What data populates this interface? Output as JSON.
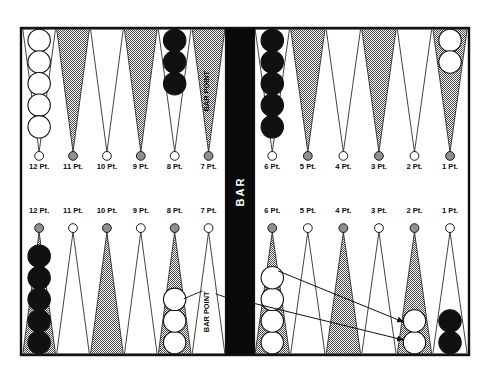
{
  "headers": {
    "top_left": "BLACK'S OUTER BOARD",
    "top_right": "BLACK'S HOME BOARD",
    "bottom_left": "WHITE'S OUTER BOARD",
    "bottom_right": "WHITE'S HOME BOARD"
  },
  "bar": {
    "label": "BAR",
    "color": "#0a0a0a",
    "text_color": "#ffffff"
  },
  "annotations": {
    "bar_point_top": "BAR POINT",
    "bar_point_bottom": "BAR POINT"
  },
  "colors": {
    "point_light": "#ffffff",
    "point_dark": "#a8a8a8",
    "checker_black": "#111111",
    "checker_white": "#ffffff",
    "border": "#111111",
    "text": "#0c0c0c"
  },
  "points": {
    "top": [
      {
        "label": "12 Pt.",
        "triangle": "light",
        "nub": "white",
        "checkers": 5,
        "checker_color": "white"
      },
      {
        "label": "11 Pt.",
        "triangle": "dark",
        "nub": "gray",
        "checkers": 0,
        "checker_color": "none"
      },
      {
        "label": "10 Pt.",
        "triangle": "light",
        "nub": "white",
        "checkers": 0,
        "checker_color": "none"
      },
      {
        "label": "9 Pt.",
        "triangle": "dark",
        "nub": "gray",
        "checkers": 0,
        "checker_color": "none"
      },
      {
        "label": "8 Pt.",
        "triangle": "light",
        "nub": "white",
        "checkers": 3,
        "checker_color": "black"
      },
      {
        "label": "7 Pt.",
        "triangle": "dark",
        "nub": "gray",
        "checkers": 0,
        "checker_color": "none",
        "note": "BAR POINT"
      },
      {
        "label": "6 Pt.",
        "triangle": "light",
        "nub": "white",
        "checkers": 5,
        "checker_color": "black"
      },
      {
        "label": "5 Pt.",
        "triangle": "dark",
        "nub": "gray",
        "checkers": 0,
        "checker_color": "none"
      },
      {
        "label": "4 Pt.",
        "triangle": "light",
        "nub": "white",
        "checkers": 0,
        "checker_color": "none"
      },
      {
        "label": "3 Pt.",
        "triangle": "dark",
        "nub": "gray",
        "checkers": 0,
        "checker_color": "none"
      },
      {
        "label": "2 Pt.",
        "triangle": "light",
        "nub": "white",
        "checkers": 0,
        "checker_color": "none"
      },
      {
        "label": "1 Pt.",
        "triangle": "dark",
        "nub": "gray",
        "checkers": 2,
        "checker_color": "white"
      }
    ],
    "bottom": [
      {
        "label": "12 Pt.",
        "triangle": "dark",
        "nub": "gray",
        "checkers": 5,
        "checker_color": "black"
      },
      {
        "label": "11 Pt.",
        "triangle": "light",
        "nub": "white",
        "checkers": 0,
        "checker_color": "none"
      },
      {
        "label": "10 Pt.",
        "triangle": "dark",
        "nub": "gray",
        "checkers": 0,
        "checker_color": "none"
      },
      {
        "label": "9 Pt.",
        "triangle": "light",
        "nub": "white",
        "checkers": 0,
        "checker_color": "none"
      },
      {
        "label": "8 Pt.",
        "triangle": "dark",
        "nub": "gray",
        "checkers": 3,
        "checker_color": "white",
        "note": "BAR POINT"
      },
      {
        "label": "7 Pt.",
        "triangle": "light",
        "nub": "white",
        "checkers": 0,
        "checker_color": "none"
      },
      {
        "label": "6 Pt.",
        "triangle": "dark",
        "nub": "gray",
        "checkers": 4,
        "checker_color": "white"
      },
      {
        "label": "5 Pt.",
        "triangle": "light",
        "nub": "white",
        "checkers": 0,
        "checker_color": "none"
      },
      {
        "label": "4 Pt.",
        "triangle": "dark",
        "nub": "gray",
        "checkers": 0,
        "checker_color": "none"
      },
      {
        "label": "3 Pt.",
        "triangle": "light",
        "nub": "white",
        "checkers": 0,
        "checker_color": "none"
      },
      {
        "label": "2 Pt.",
        "triangle": "dark",
        "nub": "gray",
        "checkers": 2,
        "checker_color": "white"
      },
      {
        "label": "1 Pt.",
        "triangle": "light",
        "nub": "white",
        "checkers": 2,
        "checker_color": "black"
      }
    ]
  }
}
